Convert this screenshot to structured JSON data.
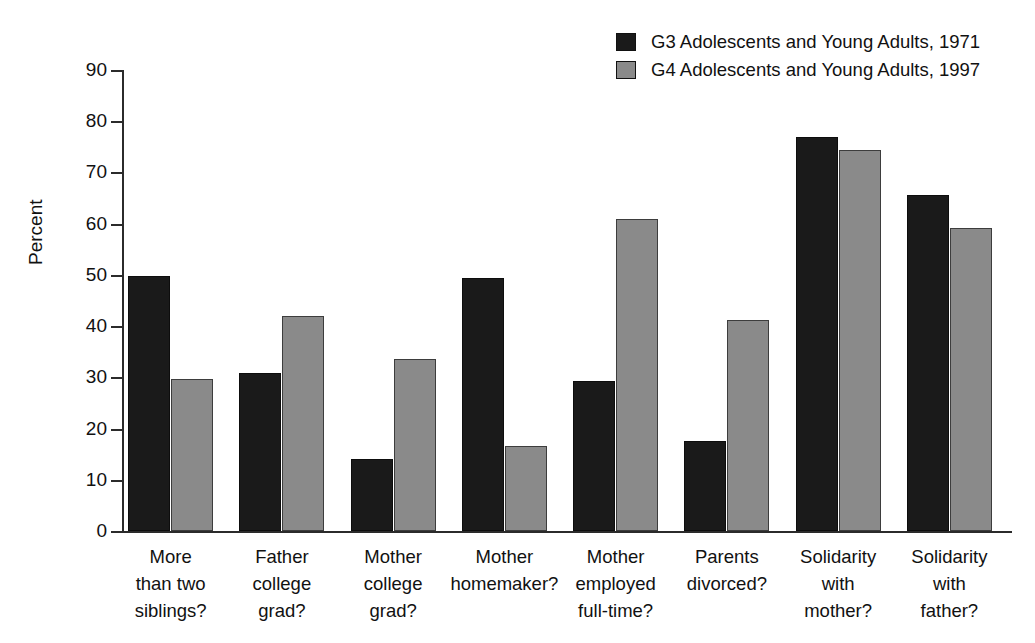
{
  "chart_data": {
    "type": "bar",
    "title": "",
    "xlabel": "",
    "ylabel": "Percent",
    "ylim": [
      0,
      90
    ],
    "yticks": [
      0,
      10,
      20,
      30,
      40,
      50,
      60,
      70,
      80,
      90
    ],
    "grid": false,
    "legend_position": "top-right",
    "categories": [
      "More than two siblings?",
      "Father college grad?",
      "Mother college grad?",
      "Mother homemaker?",
      "Mother employed full-time?",
      "Parents divorced?",
      "Solidarity with mother?",
      "Solidarity with father?"
    ],
    "category_lines": [
      [
        "More",
        "than two",
        "siblings?"
      ],
      [
        "Father",
        "college",
        "grad?"
      ],
      [
        "Mother",
        "college",
        "grad?"
      ],
      [
        "Mother",
        "homemaker?",
        ""
      ],
      [
        "Mother",
        "employed",
        "full-time?"
      ],
      [
        "Parents",
        "divorced?",
        ""
      ],
      [
        "Solidarity",
        "with",
        "mother?"
      ],
      [
        "Solidarity",
        "with",
        "father?"
      ]
    ],
    "series": [
      {
        "name": "G3 Adolescents and Young Adults, 1971",
        "color": "#1a1a1a",
        "values": [
          49.8,
          30.9,
          14.1,
          49.4,
          29.2,
          17.6,
          77.0,
          65.6
        ]
      },
      {
        "name": "G4 Adolescents and Young Adults, 1997",
        "color": "#8a8a8a",
        "values": [
          29.6,
          41.9,
          33.5,
          16.6,
          61.0,
          41.2,
          74.4,
          59.2
        ]
      }
    ]
  },
  "legend": {
    "items": [
      {
        "label": "G3 Adolescents and Young Adults, 1971",
        "swatch": "dark"
      },
      {
        "label": "G4 Adolescents and Young Adults, 1997",
        "swatch": "gray"
      }
    ]
  },
  "axes": {
    "y_axis_title": "Percent",
    "y_tick_labels": [
      "90",
      "80",
      "70",
      "60",
      "50",
      "40",
      "30",
      "20",
      "10",
      "0"
    ]
  }
}
